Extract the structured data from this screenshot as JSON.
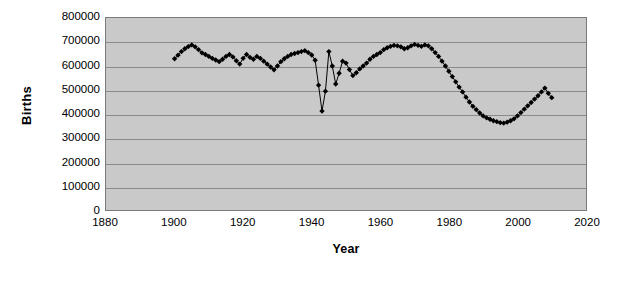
{
  "chart_data": {
    "type": "line",
    "title": "",
    "subtitle": "",
    "xlabel": "Year",
    "ylabel": "Births",
    "xlim": [
      1880,
      2020
    ],
    "ylim": [
      0,
      800000
    ],
    "xticks": [
      1880,
      1900,
      1920,
      1940,
      1960,
      1980,
      2000,
      2020
    ],
    "yticks": [
      0,
      100000,
      200000,
      300000,
      400000,
      500000,
      600000,
      700000,
      800000
    ],
    "xtick_labels": [
      "1880",
      "1900",
      "1920",
      "1940",
      "1960",
      "1980",
      "2000",
      "2020"
    ],
    "ytick_labels": [
      "0",
      "100000",
      "200000",
      "300000",
      "400000",
      "500000",
      "600000",
      "700000",
      "800000"
    ],
    "grid": "horizontal",
    "legend": "none",
    "marker": "diamond",
    "line_color": "#000000",
    "marker_color": "#000000",
    "plot_background": "#c9c9c9",
    "gridline_color": "#8a8a8a",
    "figure_background": "#ffffff",
    "series": [
      {
        "name": "Births",
        "x": [
          1900,
          1901,
          1902,
          1903,
          1904,
          1905,
          1906,
          1907,
          1908,
          1909,
          1910,
          1911,
          1912,
          1913,
          1914,
          1915,
          1916,
          1917,
          1918,
          1919,
          1920,
          1921,
          1922,
          1923,
          1924,
          1925,
          1926,
          1927,
          1928,
          1929,
          1930,
          1931,
          1932,
          1933,
          1934,
          1935,
          1936,
          1937,
          1938,
          1939,
          1940,
          1941,
          1942,
          1943,
          1944,
          1945,
          1946,
          1947,
          1948,
          1949,
          1950,
          1951,
          1952,
          1953,
          1954,
          1955,
          1956,
          1957,
          1958,
          1959,
          1960,
          1961,
          1962,
          1963,
          1964,
          1965,
          1966,
          1967,
          1968,
          1969,
          1970,
          1971,
          1972,
          1973,
          1974,
          1975,
          1976,
          1977,
          1978,
          1979,
          1980,
          1981,
          1982,
          1983,
          1984,
          1985,
          1986,
          1987,
          1988,
          1989,
          1990,
          1991,
          1992,
          1993,
          1994,
          1995,
          1996,
          1997,
          1998,
          1999,
          2000,
          2001,
          2002,
          2003,
          2004,
          2005,
          2006,
          2007,
          2008,
          2009,
          2010
        ],
        "values": [
          630000,
          645000,
          660000,
          672000,
          681000,
          688000,
          680000,
          668000,
          655000,
          648000,
          640000,
          632000,
          625000,
          618000,
          628000,
          640000,
          648000,
          638000,
          622000,
          608000,
          632000,
          648000,
          636000,
          628000,
          640000,
          632000,
          620000,
          608000,
          596000,
          584000,
          600000,
          618000,
          630000,
          640000,
          648000,
          652000,
          656000,
          660000,
          664000,
          656000,
          646000,
          624000,
          520000,
          412000,
          495000,
          660000,
          600000,
          525000,
          570000,
          620000,
          612000,
          585000,
          560000,
          572000,
          588000,
          600000,
          612000,
          628000,
          640000,
          648000,
          656000,
          668000,
          676000,
          682000,
          686000,
          684000,
          680000,
          672000,
          676000,
          684000,
          690000,
          686000,
          682000,
          688000,
          684000,
          672000,
          656000,
          640000,
          620000,
          600000,
          578000,
          556000,
          534000,
          512000,
          492000,
          470000,
          450000,
          432000,
          418000,
          404000,
          392000,
          384000,
          378000,
          372000,
          368000,
          364000,
          362000,
          366000,
          372000,
          380000,
          392000,
          406000,
          420000,
          434000,
          448000,
          462000,
          476000,
          492000,
          508000,
          486000,
          468000
        ]
      }
    ]
  }
}
